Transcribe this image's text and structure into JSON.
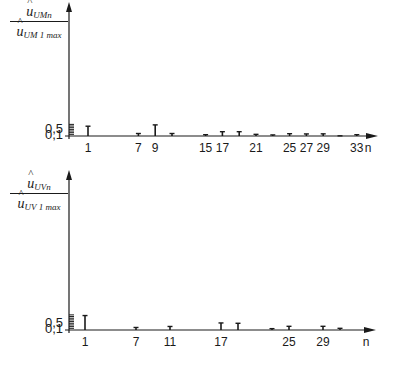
{
  "chart_data": [
    {
      "type": "bar",
      "subtype": "stem-spectrum",
      "title": "",
      "ylabel_numerator": "û",
      "ylabel_numerator_sub": "UMn",
      "ylabel_denominator": "û",
      "ylabel_denominator_sub": "UM 1 max",
      "xlabel": "n",
      "ytick_labels": [
        "0,1",
        "0,5"
      ],
      "ytick_values": [
        0.1,
        0.5
      ],
      "ylim": [
        0,
        0.72
      ],
      "xtick_labels": [
        "1",
        "7",
        "9",
        "15",
        "17",
        "21",
        "25",
        "27",
        "29",
        "33"
      ],
      "x": [
        1,
        7,
        9,
        11,
        15,
        17,
        19,
        21,
        23,
        25,
        27,
        29,
        31,
        33
      ],
      "values": [
        0.59,
        0.15,
        0.67,
        0.15,
        0.08,
        0.26,
        0.26,
        0.1,
        0.065,
        0.14,
        0.125,
        0.13,
        0.01,
        0.08
      ],
      "grid": false,
      "legend": null
    },
    {
      "type": "bar",
      "subtype": "stem-spectrum",
      "title": "",
      "ylabel_numerator": "û",
      "ylabel_numerator_sub": "UVn",
      "ylabel_denominator": "û",
      "ylabel_denominator_sub": "UV 1 max",
      "xlabel": "n",
      "ytick_labels": [
        "0,1",
        "0,5"
      ],
      "ytick_values": [
        0.1,
        0.5
      ],
      "ylim": [
        0,
        0.9
      ],
      "xtick_labels": [
        "1",
        "7",
        "11",
        "17",
        "25",
        "29"
      ],
      "x": [
        1,
        7,
        11,
        17,
        19,
        23,
        25,
        29,
        31
      ],
      "values": [
        0.86,
        0.15,
        0.21,
        0.42,
        0.4,
        0.08,
        0.22,
        0.22,
        0.1
      ],
      "grid": false,
      "legend": null
    }
  ],
  "charts": {
    "top": {
      "ylabel_num": "u",
      "ylabel_num_sub": "UMn",
      "ylabel_den": "u",
      "ylabel_den_sub": "UM 1 max",
      "xlabel": "n"
    },
    "bottom": {
      "ylabel_num": "u",
      "ylabel_num_sub": "UVn",
      "ylabel_den": "u",
      "ylabel_den_sub": "UV 1 max",
      "xlabel": "n"
    }
  }
}
